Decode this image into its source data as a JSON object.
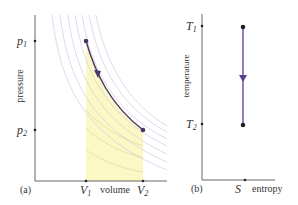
{
  "panel_a": {
    "tag": "(a)",
    "ylabel": "pressure",
    "xlabel": "volume",
    "y_ticks": [
      {
        "label": "p",
        "sub": "1"
      },
      {
        "label": "p",
        "sub": "2"
      }
    ],
    "x_ticks": [
      {
        "label": "V",
        "sub": "1"
      },
      {
        "label": "V",
        "sub": "2"
      }
    ],
    "isotherm_count": 7,
    "shading_color": "#fbf8c4",
    "process_color": "#4b3568"
  },
  "panel_b": {
    "tag": "(b)",
    "ylabel": "temperature",
    "xlabel": "entropy",
    "y_ticks": [
      {
        "label": "T",
        "sub": "1"
      },
      {
        "label": "T",
        "sub": "2"
      }
    ],
    "x_ticks": [
      {
        "label": "S"
      }
    ],
    "process_color": "#6a4aa0"
  }
}
